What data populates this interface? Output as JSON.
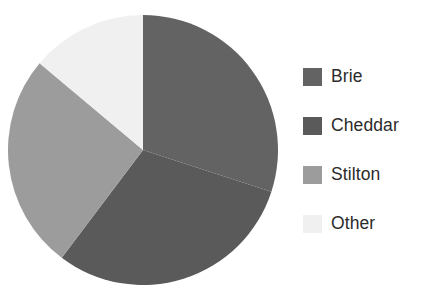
{
  "chart_data": {
    "type": "pie",
    "title": "",
    "subtitle": "",
    "xlabel": "",
    "ylabel": "",
    "grid": false,
    "legend_position": "right",
    "start_angle_deg": 0,
    "direction": "clockwise",
    "categories": [
      "Brie",
      "Cheddar",
      "Stilton",
      "Other"
    ],
    "values": [
      30,
      30,
      26,
      14
    ],
    "units": "percent",
    "slices": [
      {
        "label": "Brie",
        "value": 30,
        "percent": 30,
        "color": "#636363",
        "start_angle_deg": 0,
        "end_angle_deg": 108
      },
      {
        "label": "Cheddar",
        "value": 30,
        "percent": 30,
        "color": "#5a5a5a",
        "start_angle_deg": 108,
        "end_angle_deg": 217
      },
      {
        "label": "Stilton",
        "value": 26,
        "percent": 26,
        "color": "#9c9c9c",
        "start_angle_deg": 217,
        "end_angle_deg": 310
      },
      {
        "label": "Other",
        "value": 14,
        "percent": 14,
        "color": "#f0f0f0",
        "start_angle_deg": 310,
        "end_angle_deg": 360
      }
    ]
  },
  "legend": {
    "items": [
      {
        "label": "Brie",
        "color": "#636363",
        "swatch_name": "legend-swatch-brie"
      },
      {
        "label": "Cheddar",
        "color": "#5a5a5a",
        "swatch_name": "legend-swatch-cheddar"
      },
      {
        "label": "Stilton",
        "color": "#9c9c9c",
        "swatch_name": "legend-swatch-stilton"
      },
      {
        "label": "Other",
        "color": "#f0f0f0",
        "swatch_name": "legend-swatch-other"
      }
    ]
  },
  "colors": {
    "background": "#ffffff",
    "text": "#2b2b2b",
    "brie": "#636363",
    "cheddar": "#5a5a5a",
    "stilton": "#9c9c9c",
    "other": "#f0f0f0"
  },
  "geometry": {
    "center_x": 143,
    "center_y": 150,
    "radius": 135
  }
}
